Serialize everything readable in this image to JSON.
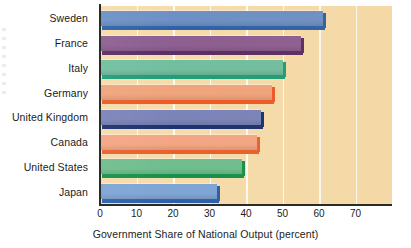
{
  "chart_data": {
    "type": "bar",
    "orientation": "horizontal",
    "title": "",
    "xlabel": "Government Share of National Output (percent)",
    "ylabel": "",
    "categories": [
      "Sweden",
      "France",
      "Italy",
      "Germany",
      "United Kingdom",
      "Canada",
      "United States",
      "Japan"
    ],
    "values": [
      61,
      55,
      50,
      47,
      44,
      43,
      39,
      32
    ],
    "xlim": [
      0,
      80
    ],
    "xticks": [
      0,
      10,
      20,
      30,
      40,
      50,
      60,
      70
    ],
    "xticklabels": [
      "0",
      "10",
      "20",
      "30",
      "40",
      "50",
      "60",
      "70"
    ],
    "grid": "vertical-white",
    "legend": "none",
    "plot_background": "#f6dcab",
    "series": [
      {
        "name": "Government Share of National Output (percent)",
        "values": [
          61,
          55,
          50,
          47,
          44,
          43,
          39,
          32
        ]
      }
    ],
    "bar_colors": [
      {
        "category": "Sweden",
        "face": "#6d91c6",
        "shade": "#2f62a8"
      },
      {
        "category": "France",
        "face": "#8d5f92",
        "shade": "#5d2d63"
      },
      {
        "category": "Italy",
        "face": "#72bfa0",
        "shade": "#1f9e78"
      },
      {
        "category": "Germany",
        "face": "#f0a47c",
        "shade": "#ee5a28"
      },
      {
        "category": "United Kingdom",
        "face": "#7b84b9",
        "shade": "#1d3270"
      },
      {
        "category": "Canada",
        "face": "#f4a684",
        "shade": "#e8622e"
      },
      {
        "category": "United States",
        "face": "#6fbe8e",
        "shade": "#16924a"
      },
      {
        "category": "Japan",
        "face": "#7fa5d5",
        "shade": "#2e5fa8"
      }
    ]
  },
  "axis": {
    "spine_color": "#2a2a26",
    "gridline_color": "#ffffff"
  }
}
